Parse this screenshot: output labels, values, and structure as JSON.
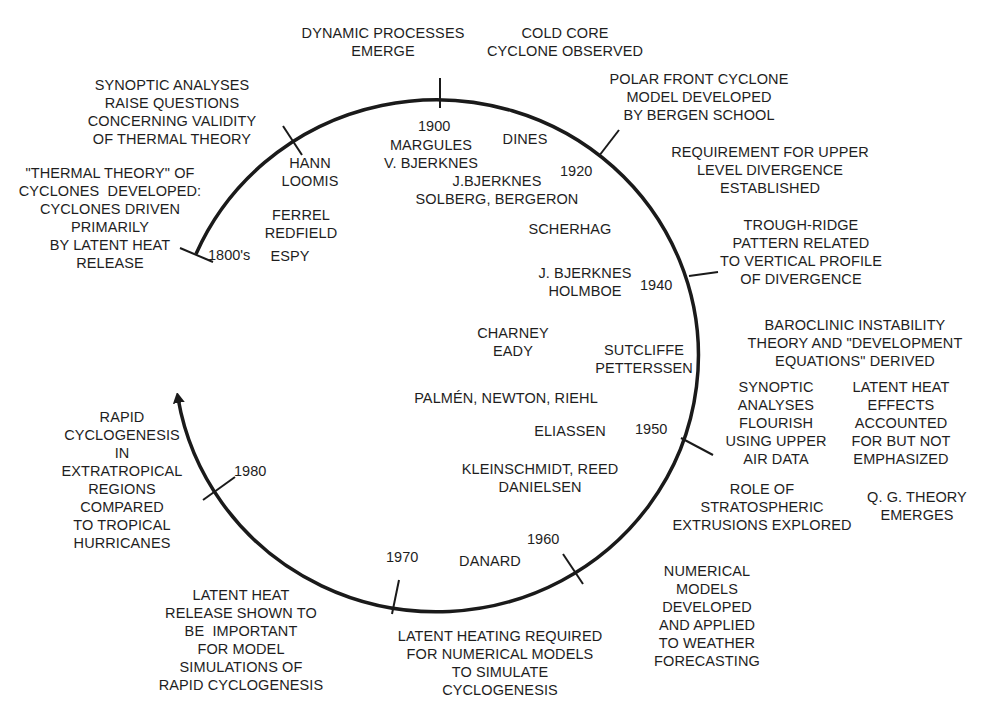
{
  "diagram": {
    "type": "circular-timeline",
    "colors": {
      "line": "#1a1a1a",
      "text": "#1e1e1e",
      "background": "#ffffff"
    },
    "years": [
      {
        "id": "y1800s",
        "label": "1800's",
        "x": 208,
        "y": 246
      },
      {
        "id": "y1900",
        "label": "1900",
        "x": 418,
        "y": 117
      },
      {
        "id": "y1920",
        "label": "1920",
        "x": 560,
        "y": 162
      },
      {
        "id": "y1940",
        "label": "1940",
        "x": 548,
        "y": 276
      },
      {
        "id": "y1950",
        "label": "1950",
        "x": 635,
        "y": 420
      },
      {
        "id": "y1960",
        "label": "1960",
        "x": 528,
        "y": 530
      },
      {
        "id": "y1970",
        "label": "1970",
        "x": 386,
        "y": 548
      },
      {
        "id": "y1980",
        "label": "1980",
        "x": 234,
        "y": 462
      }
    ],
    "scientists": [
      {
        "id": "hann-loomis",
        "text": "HANN\nLOOMIS",
        "x": 308,
        "y": 154
      },
      {
        "id": "ferrel-redfield",
        "text": "FERREL\nREDFIELD",
        "x": 301,
        "y": 206
      },
      {
        "id": "espy",
        "text": "ESPY",
        "x": 290,
        "y": 247
      },
      {
        "id": "margules-vbjerknes",
        "text": "MARGULES\nV. BJERKNES",
        "x": 431,
        "y": 136
      },
      {
        "id": "dines",
        "text": "DINES",
        "x": 525,
        "y": 130
      },
      {
        "id": "jbjerknes-solberg",
        "text": "J.BJERKNES\nSOLBERG, BERGERON",
        "x": 497,
        "y": 172
      },
      {
        "id": "scherhag",
        "text": "SCHERHAG",
        "x": 570,
        "y": 220
      },
      {
        "id": "jbjerknes-holmboe",
        "text": "J. BJERKNES\nHOLMBOE",
        "x": 585,
        "y": 264
      },
      {
        "id": "charney-eady",
        "text": "CHARNEY\nEADY",
        "x": 513,
        "y": 324
      },
      {
        "id": "sutcliffe-petterssen",
        "text": "SUTCLIFFE\nPETTERSSEN",
        "x": 644,
        "y": 340
      },
      {
        "id": "palmen-newton-riehl",
        "text": "PALMÉN, NEWTON, RIEHL",
        "x": 506,
        "y": 389
      },
      {
        "id": "eliassen",
        "text": "ELIASSEN",
        "x": 570,
        "y": 422
      },
      {
        "id": "kleinschmidt-reed-danielsen",
        "text": "KLEINSCHMIDT, REED\nDANIELSEN",
        "x": 540,
        "y": 460
      },
      {
        "id": "danard",
        "text": "DANARD",
        "x": 490,
        "y": 552
      }
    ],
    "developments": [
      {
        "id": "dynamic-processes",
        "text": "DYNAMIC PROCESSES\nEMERGE",
        "x": 383,
        "y": 24
      },
      {
        "id": "cold-core",
        "text": "COLD CORE\nCYCLONE OBSERVED",
        "x": 565,
        "y": 24
      },
      {
        "id": "polar-front",
        "text": "POLAR FRONT CYCLONE\nMODEL DEVELOPED\nBY BERGEN SCHOOL",
        "x": 699,
        "y": 70
      },
      {
        "id": "upper-divergence",
        "text": "REQUIREMENT FOR UPPER\nLEVEL DIVERGENCE\nESTABLISHED",
        "x": 770,
        "y": 143
      },
      {
        "id": "trough-ridge",
        "text": "TROUGH-RIDGE\nPATTERN RELATED\nTO VERTICAL PROFILE\nOF DIVERGENCE",
        "x": 801,
        "y": 216
      },
      {
        "id": "baroclinic",
        "text": "BAROCLINIC INSTABILITY\nTHEORY AND \"DEVELOPMENT\nEQUATIONS\" DERIVED",
        "x": 855,
        "y": 316
      },
      {
        "id": "synoptic-flourish",
        "text": "SYNOPTIC\nANALYSES\nFLOURISH\nUSING UPPER\nAIR DATA",
        "x": 776,
        "y": 378
      },
      {
        "id": "latent-heat-effects",
        "text": "LATENT HEAT\nEFFECTS\nACCOUNTED\nFOR BUT NOT\nEMPHASIZED",
        "x": 901,
        "y": 378
      },
      {
        "id": "stratospheric",
        "text": "ROLE OF\nSTRATOSPHERIC\nEXTRUSIONS EXPLORED",
        "x": 762,
        "y": 480
      },
      {
        "id": "qg-theory",
        "text": "Q. G. THEORY\nEMERGES",
        "x": 917,
        "y": 488
      },
      {
        "id": "numerical-models",
        "text": "NUMERICAL\nMODELS\nDEVELOPED\nAND APPLIED\nTO WEATHER\nFORECASTING",
        "x": 707,
        "y": 562
      },
      {
        "id": "latent-heating-required",
        "text": "LATENT HEATING REQUIRED\nFOR NUMERICAL MODELS\nTO SIMULATE\nCYCLOGENESIS",
        "x": 500,
        "y": 627
      },
      {
        "id": "latent-heat-release",
        "text": "LATENT HEAT\nRELEASE SHOWN TO\nBE  IMPORTANT\nFOR MODEL\nSIMULATIONS OF\nRAPID CYCLOGENESIS",
        "x": 241,
        "y": 588
      },
      {
        "id": "rapid-cyclogenesis",
        "text": "RAPID\nCYCLOGENESIS\nIN\nEXTRATROPICAL\nREGIONS\nCOMPARED\nTO TROPICAL\nHURRICANES",
        "x": 122,
        "y": 408
      },
      {
        "id": "thermal-theory",
        "text": "\"THERMAL THEORY\" OF\nCYCLONES  DEVELOPED:\nCYCLONES DRIVEN\nPRIMARILY\nBY LATENT HEAT\nRELEASE",
        "x": 115,
        "y": 164
      },
      {
        "id": "synoptic-questions",
        "text": "SYNOPTIC ANALYSES\nRAISE QUESTIONS\nCONCERNING VALIDITY\nOF THERMAL THEORY",
        "x": 172,
        "y": 76
      }
    ]
  }
}
